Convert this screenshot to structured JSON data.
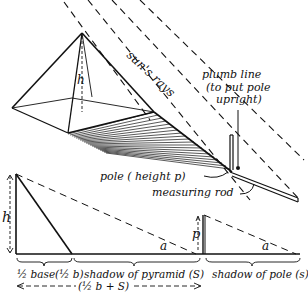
{
  "labels": {
    "h_top": "h",
    "suns_rays": "sun's rays",
    "plumb_line_1": "plumb line",
    "plumb_line_2": "(to put pole",
    "plumb_line_3": "upright)",
    "pole": "pole ( height p)",
    "measuring_rod": "measuring rod",
    "h_bottom": "h",
    "p": "p",
    "alpha_1": "a",
    "alpha_2": "a",
    "half_base": "½ base(½ b)",
    "shadow_pyramid": "shadow of pyramid (S)",
    "shadow_pole": "shadow of pole (s)",
    "total": "(½ b + S)"
  },
  "colors": {
    "ink": "#111111",
    "background": "#ffffff"
  }
}
